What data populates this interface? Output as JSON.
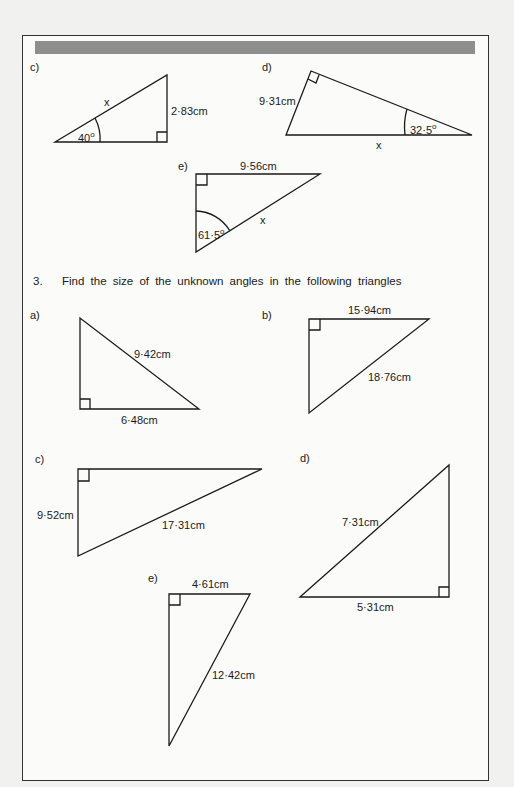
{
  "continued_exercise": {
    "c": {
      "label": "c)",
      "side": "x",
      "opposite": "2·83cm",
      "angle": "40",
      "angle_unit": "o"
    },
    "d": {
      "label": "d)",
      "side_left": "9·31cm",
      "side_bottom": "x",
      "angle": "32·5",
      "angle_unit": "o"
    },
    "e": {
      "label": "e)",
      "side_top": "9·56cm",
      "hyp": "x",
      "angle": "61·5",
      "angle_unit": "o"
    }
  },
  "question3": {
    "number": "3.",
    "text": "Find the size of the unknown angles in the following triangles",
    "a": {
      "label": "a)",
      "hyp": "9·42cm",
      "base": "6·48cm"
    },
    "b": {
      "label": "b)",
      "top": "15·94cm",
      "hyp": "18·76cm"
    },
    "c": {
      "label": "c)",
      "left": "9·52cm",
      "hyp": "17·31cm"
    },
    "d": {
      "label": "d)",
      "hyp": "7·31cm",
      "base": "5·31cm"
    },
    "e": {
      "label": "e)",
      "top": "4·61cm",
      "hyp": "12·42cm"
    }
  }
}
